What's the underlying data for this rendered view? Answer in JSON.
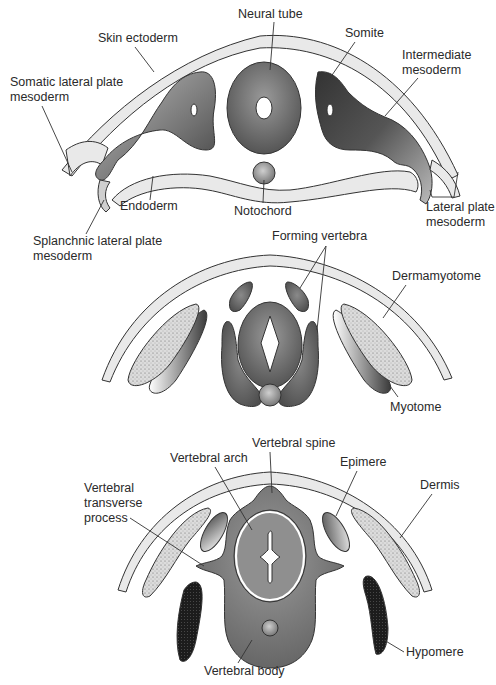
{
  "figure": {
    "panels": [
      {
        "id": "early-somite-stage",
        "labels": {
          "neural_tube": "Neural tube",
          "skin_ectoderm": "Skin ectoderm",
          "somite": "Somite",
          "intermediate_mesoderm_1": "Intermediate",
          "intermediate_mesoderm_2": "mesoderm",
          "somatic_lpm_1": "Somatic lateral plate",
          "somatic_lpm_2": "mesoderm",
          "endoderm": "Endoderm",
          "notochord": "Notochord",
          "splanchnic_lpm_1": "Splanchnic lateral plate",
          "splanchnic_lpm_2": "mesoderm",
          "lateral_plate_mesoderm_1": "Lateral plate",
          "lateral_plate_mesoderm_2": "mesoderm"
        }
      },
      {
        "id": "forming-vertebra-stage",
        "labels": {
          "forming_vertebra": "Forming vertebra",
          "dermamyotome": "Dermamyotome",
          "myotome": "Myotome"
        }
      },
      {
        "id": "vertebra-stage",
        "labels": {
          "vertebral_spine": "Vertebral spine",
          "vertebral_arch": "Vertebral arch",
          "epimere": "Epimere",
          "dermis": "Dermis",
          "vertebral_transverse_process_1": "Vertebral",
          "vertebral_transverse_process_2": "transverse",
          "vertebral_transverse_process_3": "process",
          "vertebral_body": "Vertebral body",
          "hypomere": "Hypomere"
        }
      }
    ],
    "colors": {
      "ectoderm": "#e9e9e9",
      "tissue_dark": "#4a4a4a",
      "tissue_mid": "#7a7a7a",
      "tissue_light": "#bdbdbd",
      "dermis_stipple": "#d4d4d4",
      "hypomere": "#1e1e1e",
      "outline": "#333333"
    }
  }
}
